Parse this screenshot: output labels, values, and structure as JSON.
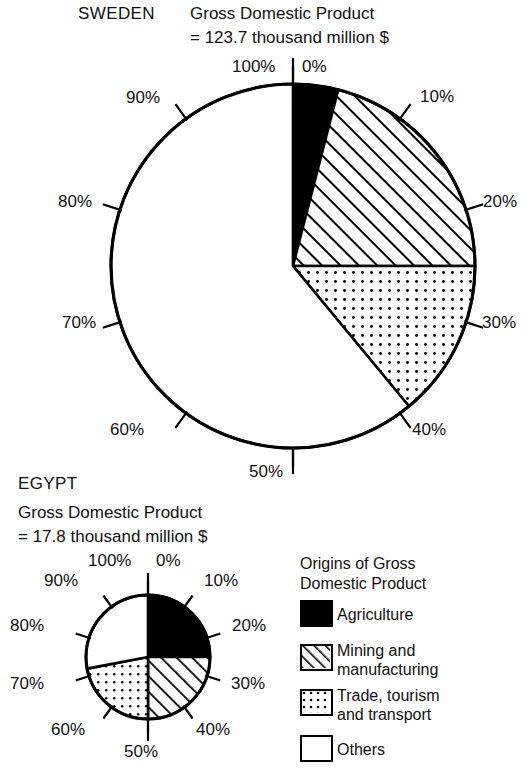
{
  "chart_data": {
    "type": "pie",
    "charts": [
      {
        "name": "SWEDEN",
        "gdp_line1": "Gross Domestic Product",
        "gdp_line2": "= 123.7 thousand million $",
        "categories": [
          "Agriculture",
          "Mining and manufacturing",
          "Trade, tourism and transport",
          "Others"
        ],
        "values": [
          4,
          21,
          14,
          61
        ],
        "cumulative": [
          0,
          4,
          25,
          39,
          100
        ],
        "tick_labels": [
          "0%",
          "10%",
          "20%",
          "30%",
          "40%",
          "50%",
          "60%",
          "70%",
          "80%",
          "90%",
          "100%"
        ]
      },
      {
        "name": "EGYPT",
        "gdp_line1": "Gross Domestic Product",
        "gdp_line2": "= 17.8 thousand million $",
        "categories": [
          "Agriculture",
          "Mining and manufacturing",
          "Trade, tourism and transport",
          "Others"
        ],
        "values": [
          25,
          25,
          22,
          28
        ],
        "cumulative": [
          0,
          25,
          50,
          72,
          100
        ],
        "tick_labels": [
          "0%",
          "10%",
          "20%",
          "30%",
          "40%",
          "50%",
          "60%",
          "70%",
          "80%",
          "90%",
          "100%"
        ]
      }
    ],
    "legend_position": "bottom-right",
    "grid": false
  },
  "sweden": {
    "country": "SWEDEN",
    "gdp_line1": "Gross Domestic Product",
    "gdp_line2": "= 123.7 thousand million $",
    "ticks": {
      "t0": "0%",
      "t10": "10%",
      "t20": "20%",
      "t30": "30%",
      "t40": "40%",
      "t50": "50%",
      "t60": "60%",
      "t70": "70%",
      "t80": "80%",
      "t90": "90%",
      "t100": "100%"
    }
  },
  "egypt": {
    "country": "EGYPT",
    "gdp_line1": "Gross Domestic Product",
    "gdp_line2": "= 17.8 thousand million $",
    "ticks": {
      "t0": "0%",
      "t10": "10%",
      "t20": "20%",
      "t30": "30%",
      "t40": "40%",
      "t50": "50%",
      "t60": "60%",
      "t70": "70%",
      "t80": "80%",
      "t90": "90%",
      "t100": "100%"
    }
  },
  "legend": {
    "title_line1": "Origins of Gross",
    "title_line2": "Domestic Product",
    "items": [
      {
        "label_line1": "Agriculture",
        "label_line2": "",
        "pattern": "solid-black"
      },
      {
        "label_line1": "Mining and",
        "label_line2": "manufacturing",
        "pattern": "diagonal-hatch"
      },
      {
        "label_line1": "Trade, tourism",
        "label_line2": "and transport",
        "pattern": "dotted"
      },
      {
        "label_line1": "Others",
        "label_line2": "",
        "pattern": "white"
      }
    ]
  },
  "colors": {
    "ink": "#111111",
    "fill_agriculture": "#000000",
    "fill_others": "#ffffff",
    "background": "#ffffff"
  }
}
